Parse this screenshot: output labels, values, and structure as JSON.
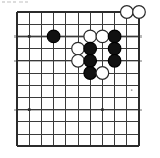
{
  "figure": {
    "kind": "go-board-diagram",
    "title": "Go board position diagram",
    "caption": "",
    "board": {
      "columns": 11,
      "rows": 12,
      "cell_size": 12.2,
      "origin_x": 17,
      "origin_y": 12,
      "line_color": "#3a3a3a",
      "border_color": "#2b2b2b",
      "faint_line_color": "#b9b9b9",
      "background_color": "#ffffff",
      "line_width": 1,
      "border_width": 1.6
    },
    "stone_style": {
      "radius": 6.3,
      "black_fill": "#111111",
      "black_edge": "#000000",
      "white_fill": "#ffffff",
      "white_edge": "#2a2a2a",
      "edge_width": 1.2
    },
    "star_points": [
      {
        "col": 2,
        "row": 3,
        "label": "hoshi-upper-left"
      },
      {
        "col": 2,
        "row": 9,
        "label": "hoshi-lower-left"
      },
      {
        "col": 8,
        "row": 9,
        "label": "hoshi-lower-right"
      }
    ],
    "star_point_size": 2.6,
    "stones": [
      {
        "col": 4,
        "row": 3,
        "color": "black",
        "name": "black-stone-d3"
      },
      {
        "col": 10,
        "row": 1,
        "color": "white",
        "name": "white-stone-j1"
      },
      {
        "col": 11,
        "row": 1,
        "color": "white",
        "name": "white-stone-k1"
      },
      {
        "col": 7,
        "row": 3,
        "color": "white",
        "name": "white-stone-g3"
      },
      {
        "col": 8,
        "row": 3,
        "color": "white",
        "name": "white-stone-h3"
      },
      {
        "col": 9,
        "row": 3,
        "color": "black",
        "name": "black-stone-i3"
      },
      {
        "col": 6,
        "row": 4,
        "color": "white",
        "name": "white-stone-f4"
      },
      {
        "col": 7,
        "row": 4,
        "color": "black",
        "name": "black-stone-g4"
      },
      {
        "col": 9,
        "row": 4,
        "color": "black",
        "name": "black-stone-i4"
      },
      {
        "col": 6,
        "row": 5,
        "color": "white",
        "name": "white-stone-f5"
      },
      {
        "col": 7,
        "row": 5,
        "color": "black",
        "name": "black-stone-g5"
      },
      {
        "col": 9,
        "row": 5,
        "color": "black",
        "name": "black-stone-i5"
      },
      {
        "col": 7,
        "row": 6,
        "color": "black",
        "name": "black-stone-g6"
      },
      {
        "col": 8,
        "row": 6,
        "color": "white",
        "name": "white-stone-h6"
      }
    ],
    "faint_rows": [
      3,
      5,
      9
    ],
    "corner_mark": {
      "col": 10.4,
      "row": 7.4,
      "name": "faint-corner-speck"
    }
  }
}
